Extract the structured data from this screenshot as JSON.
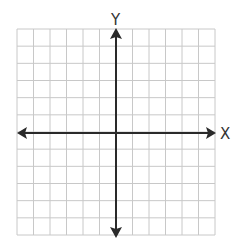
{
  "diagram": {
    "type": "coordinate-plane",
    "grid": {
      "columns": 12,
      "rows": 12,
      "line_color": "#c8c8c8"
    },
    "axes": {
      "x_label": "X",
      "y_label": "Y",
      "color": "#2a2a2a"
    }
  }
}
